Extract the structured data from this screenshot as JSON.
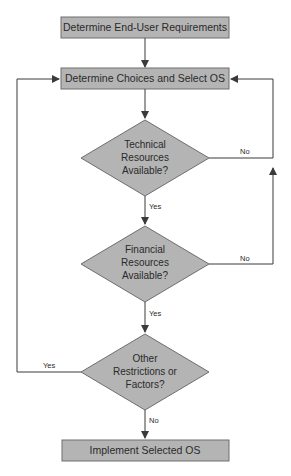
{
  "diagram": {
    "type": "flowchart",
    "colors": {
      "node_fill": "#b4b4b4",
      "node_stroke": "#6e6e6e",
      "line": "#3a3a3a",
      "text": "#2a2a2a"
    },
    "nodes": {
      "start": {
        "label": "Determine End-User Requirements"
      },
      "select": {
        "label": "Determine Choices and Select OS"
      },
      "technical": {
        "lines": [
          "Technical",
          "Resources",
          "Available?"
        ]
      },
      "financial": {
        "lines": [
          "Financial",
          "Resources",
          "Available?"
        ]
      },
      "other": {
        "lines": [
          "Other",
          "Restrictions or",
          "Factors?"
        ]
      },
      "implement": {
        "label": "Implement Selected OS"
      }
    },
    "edges": {
      "technical_yes": "Yes",
      "technical_no": "No",
      "financial_yes": "Yes",
      "financial_no": "No",
      "other_yes": "Yes",
      "other_no": "No"
    }
  }
}
